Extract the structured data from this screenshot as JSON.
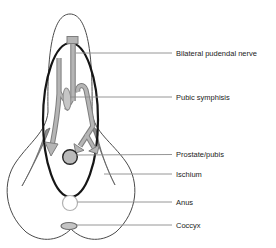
{
  "figure": {
    "labels": [
      {
        "text": "Bilateral pudendal nerve"
      },
      {
        "text": "Pubic symphisis"
      },
      {
        "text": "Prostate/pubis"
      },
      {
        "text": "Ischium"
      },
      {
        "text": "Anus"
      },
      {
        "text": "Coccyx"
      }
    ],
    "colors": {
      "background": "#ffffff",
      "body_outline": "#4a4a4a",
      "emphasis_ellipse": "#161616",
      "nerve_fill": "#b5b5b5",
      "nerve_outline": "#7e7e7e",
      "ischium_fill": "#8f8f8f",
      "symphysis_fill": "#c6c6c6",
      "prostate_fill": "#bababa",
      "anus_stroke": "#b2b2b2",
      "coccyx_fill": "#c4c4c4",
      "leader_line": "#8a8a8a",
      "label_text": "#1b1b1b"
    }
  }
}
